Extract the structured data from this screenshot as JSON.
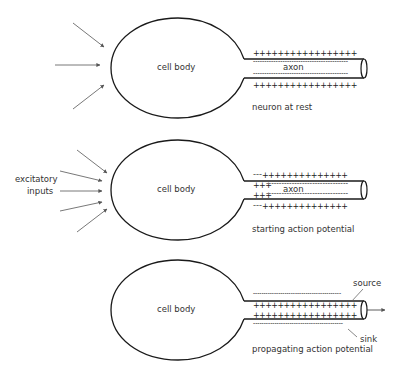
{
  "diagram": {
    "colors": {
      "stroke": "#1a1a1a",
      "arrow": "#555555",
      "text": "#333333",
      "background": "#ffffff"
    },
    "panels": [
      {
        "id": "rest",
        "cell_label": "cell body",
        "axon_label": "axon",
        "caption": "neuron at rest",
        "outer_top": "+++++++++++++++++",
        "inner_top": "------------------------------------------",
        "inner_bottom": "------------------------------------------",
        "outer_bottom": "+++++++++++++++++",
        "input_arrows": 3
      },
      {
        "id": "starting",
        "cell_label": "cell body",
        "axon_label": "axon",
        "caption": "starting action potential",
        "side_label_line1": "excitatory",
        "side_label_line2": "inputs",
        "outer_top_minus": "---",
        "outer_top_plus": "++++++++++++++",
        "inner_top_plus": "+++",
        "inner_top_minus": "--------------------------------",
        "inner_bottom_plus": "+++",
        "inner_bottom_minus": "--------------------------------",
        "outer_bottom_minus": "---",
        "outer_bottom_plus": "++++++++++++++",
        "input_arrows": 5
      },
      {
        "id": "propagating",
        "cell_label": "cell body",
        "caption": "propagating action potential",
        "outer_top": "------------------------------------------",
        "inner_top": "+++++++++++++++++",
        "inner_bottom": "+++++++++++++++++",
        "outer_bottom": "------------------------------------------",
        "source_label": "source",
        "sink_label": "sink",
        "input_arrows": 0
      }
    ]
  }
}
